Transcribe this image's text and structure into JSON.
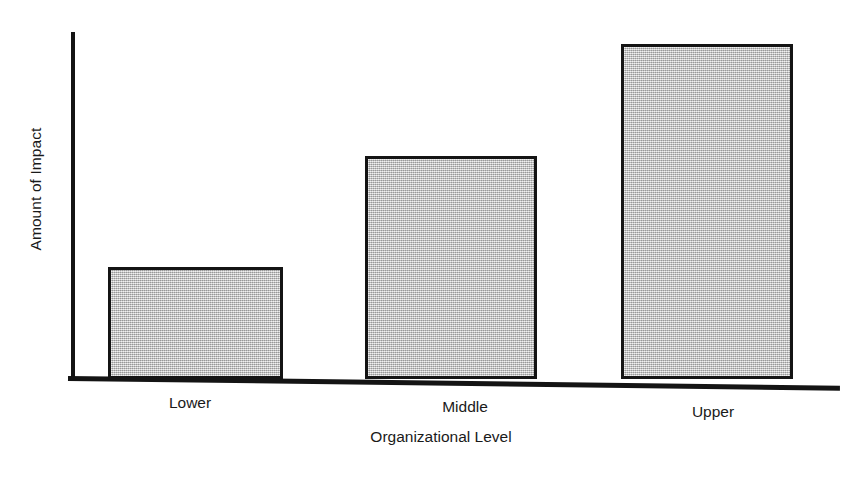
{
  "chart_data": {
    "type": "bar",
    "title": "",
    "subtitle": "",
    "categories": [
      "Lower",
      "Middle",
      "Upper"
    ],
    "values": [
      29,
      58,
      87
    ],
    "series": [
      {
        "name": "Amount of Impact",
        "values": [
          29,
          58,
          87
        ]
      }
    ],
    "xlabel": "Organizational Level",
    "ylabel": "Amount of Impact",
    "ylim": [
      0,
      100
    ],
    "y_tick_labels": [],
    "x_tick_labels": [
      "Lower",
      "Middle",
      "Upper"
    ],
    "grid": false,
    "legend": false,
    "legend_position": "none",
    "annotations": [],
    "bar_fill_color": "#c3c3c3",
    "bar_edge_color": "#141414",
    "axis_color": "#141414",
    "background_color": "#ffffff",
    "note": "Unlabeled ordinal y-axis; bar heights read as proportion of plot height."
  },
  "axes": {
    "y_title": "Amount of Impact",
    "x_title": "Organizational Level"
  },
  "bars": [
    {
      "label": "Lower",
      "value": 29
    },
    {
      "label": "Middle",
      "value": 58
    },
    {
      "label": "Upper",
      "value": 87
    }
  ]
}
